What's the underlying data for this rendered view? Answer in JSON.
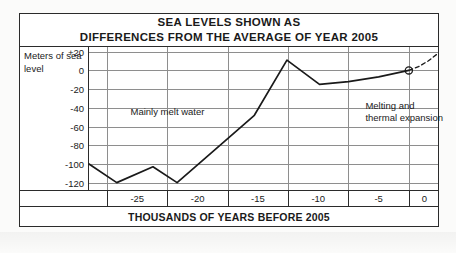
{
  "title": {
    "line1": "SEA LEVELS SHOWN AS",
    "line2": "DIFFERENCES FROM THE AVERAGE OF YEAR 2005"
  },
  "yaxis": {
    "label_line1": "Meters of sea",
    "label_line2": "level",
    "ticks": [
      "+20",
      "0",
      "-20",
      "-40",
      "-60",
      "-80",
      "-100",
      "-120"
    ]
  },
  "xaxis": {
    "title": "THOUSANDS OF YEARS BEFORE 2005",
    "ticks": [
      "-25",
      "-20",
      "-15",
      "-10",
      "-5",
      "0"
    ]
  },
  "annotations": {
    "left": "Mainly melt water",
    "right_line1": "Melting and",
    "right_line2": "thermal expansion"
  },
  "colors": {
    "frame": "#2b2b2b",
    "grid": "#8e8e8e",
    "series": "#1a1a1a",
    "paper": "#ffffff"
  },
  "chart_data": {
    "type": "line",
    "title": "SEA LEVELS SHOWN AS DIFFERENCES FROM THE AVERAGE OF YEAR 2005",
    "xlabel": "THOUSANDS OF YEARS BEFORE 2005",
    "ylabel": "Meters of sea level",
    "xlim": [
      -26.5,
      2.5
    ],
    "ylim": [
      -130,
      25
    ],
    "xticks": [
      -25,
      -20,
      -15,
      -10,
      -5,
      0
    ],
    "yticks": [
      20,
      0,
      -20,
      -40,
      -60,
      -80,
      -100,
      -120
    ],
    "grid": true,
    "legend": false,
    "series": [
      {
        "name": "Observed sea level",
        "style": "solid",
        "x": [
          -26.5,
          -24.2,
          -21.2,
          -19.2,
          -15.2,
          -12.8,
          -10.1,
          -7.4,
          -5.0,
          -2.5,
          0.0
        ],
        "y": [
          -100,
          -120,
          -103,
          -120,
          -75,
          -48,
          11,
          -15,
          -12,
          -7,
          0
        ]
      },
      {
        "name": "Projected sea level",
        "style": "dashed",
        "x": [
          0.0,
          0.8,
          1.6,
          2.4
        ],
        "y": [
          0,
          4,
          10,
          18
        ]
      }
    ],
    "markers": [
      {
        "x": 0.0,
        "y": 0,
        "shape": "circle",
        "label": "year 2005"
      }
    ],
    "annotations": [
      {
        "text": "Mainly melt water",
        "x": -20.0,
        "y": -45
      },
      {
        "text": "Melting and thermal expansion",
        "x": -3.6,
        "y": -38
      }
    ]
  }
}
